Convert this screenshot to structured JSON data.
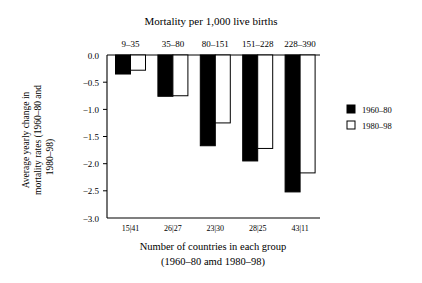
{
  "chart_data": {
    "type": "bar",
    "title": "Mortality per 1,000 live births",
    "xlabel": "Number of countries in each group",
    "xlabel2": "(1960–80 amd 1980–98)",
    "ylabel": "Average yearly change  in",
    "ylabel2": "mortality rates (1960–80 and",
    "ylabel3": "1980–98)",
    "categories": [
      "9–35",
      "35–80",
      "80–151",
      "151–228",
      "228–390"
    ],
    "group_counts": [
      "15|41",
      "26|27",
      "23|30",
      "28|25",
      "43|11"
    ],
    "series": [
      {
        "name": "1960–80",
        "color": "#000000",
        "values": [
          -0.35,
          -0.76,
          -1.67,
          -1.95,
          -2.52
        ]
      },
      {
        "name": "1980–98",
        "color": "#ffffff",
        "values": [
          -0.28,
          -0.75,
          -1.25,
          -1.72,
          -2.17
        ]
      }
    ],
    "ylim": [
      -3.0,
      0.0
    ],
    "yticks": [
      "0.0",
      "−0.5",
      "−1.0",
      "−1.5",
      "−2.0",
      "−2.5",
      "−3.0"
    ],
    "ytick_values": [
      0.0,
      -0.5,
      -1.0,
      -1.5,
      -2.0,
      -2.5,
      -3.0
    ],
    "grid": false,
    "legend_position": "right"
  }
}
